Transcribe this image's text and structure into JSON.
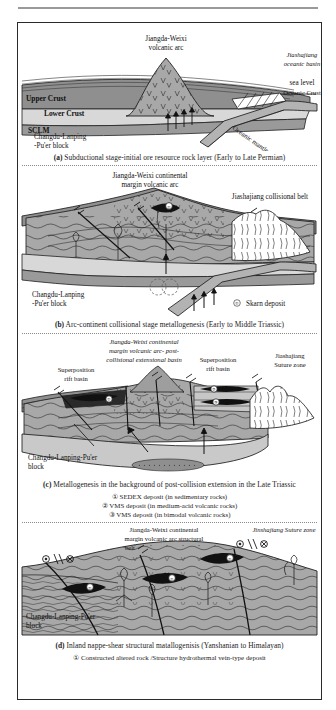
{
  "figure": {
    "title_present": false,
    "panels": [
      {
        "id": "a",
        "caption_label": "(a)",
        "caption_text": "Subductional stage-initial ore resource rock layer (Early to Late Permian)",
        "labels": {
          "arc": "Jiangda-Weixi\nvolcanic arc",
          "arc_line1": "Jiangda-Weixi",
          "arc_line2": "volcanic  arc",
          "basin_line1": "Jiashajiang",
          "basin_line2": "oceanic basin",
          "sea_level": "sea level",
          "oceanic_crust": "Oceanic Crust",
          "oceanic_mantle": "Oceanic mantle",
          "upper_crust": "Upper Crust",
          "lower_crust": "Lower Crust",
          "sclm": "SCLM",
          "block_line1": "Changdu-Lanping",
          "block_line2": "-Pu'er block"
        },
        "legend": []
      },
      {
        "id": "b",
        "caption_label": "(b)",
        "caption_text": "Arc-continent collisional stage metallogenesis (Early to Middle Triassic)",
        "labels": {
          "arc_line1": "Jiangda-Weixi continental",
          "arc_line2": "margin volcanic  arc",
          "belt": "Jiashajiang  collisional belt",
          "block_line1": "Changdu-Lanping",
          "block_line2": "-Pu'er block"
        },
        "legend": [
          {
            "marker": "①",
            "text": "Skarn  deposit"
          }
        ]
      },
      {
        "id": "c",
        "caption_label": "(c)",
        "caption_text": "Metallogenesis in the background of post-collision extension in the Late Triassic",
        "labels": {
          "arc_line1": "Jiangda-Weixi continental",
          "arc_line2": "margin volcanic  arc- post-",
          "arc_line3": "collisional extensional basin",
          "suture_line1": "Jiashajiang",
          "suture_line2": "Suture zone",
          "rift_left_line1": "Superposition",
          "rift_left_line2": "rift basin",
          "rift_right_line1": "Superposition",
          "rift_right_line2": "rift basin",
          "block_line1": "Changdu-Lanping-Pu'er",
          "block_line2": "block"
        },
        "legend": [
          {
            "marker": "①",
            "text": "SEDEX  deposit (in sedimentary rocks)"
          },
          {
            "marker": "②",
            "text": "VMS deposit (in  medium-acid  volcanic rocks)"
          },
          {
            "marker": "③",
            "text": "VMS  deposit (in bimodal  volcanic  rocks)"
          }
        ]
      },
      {
        "id": "d",
        "caption_label": "(d)",
        "caption_text": "Inland  nappe-shear  structural  matallogenisis (Yanshanian to Himalayan)",
        "labels": {
          "arc_line1": "Jiangda-Weixi continental",
          "arc_line2": "margin volcanic  arc structural",
          "arc_line3": "belt",
          "suture": "Jinshajiang  Suture zone",
          "block_line1": "Changdu-Lanping-Pu'er",
          "block_line2": "block"
        },
        "legend": [
          {
            "marker": "①",
            "text": "Constructed  altered  rock /Structure hydrothermal  vein-type deposit"
          }
        ]
      }
    ],
    "ore_markers": {
      "skarn": "①",
      "sedex": "①",
      "vms_medium_acid": "②",
      "vms_bimodal": "③",
      "vein_type": "①"
    },
    "colors": {
      "upper_crust": "#8f8f8f",
      "lower_crust": "#d8d8d8",
      "sclm": "#9a9a9a",
      "mantle_block": "#c9c9c9",
      "slab": "#b3b3b3",
      "arc_fill": "#a8a8a8",
      "ore_black": "#111111",
      "line": "#1f1f1f",
      "paper": "#ffffff"
    }
  }
}
